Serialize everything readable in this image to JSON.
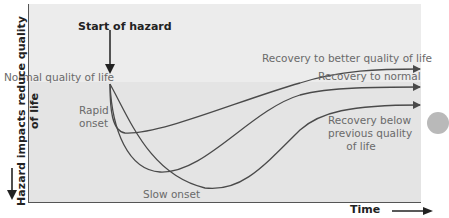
{
  "diagram": {
    "title_marker": "Start of hazard",
    "y_axis_label": "Hazard impacts reduce quality of life",
    "x_axis_label": "Time",
    "baseline_label": "Normal quality of life",
    "onset_labels": {
      "rapid": "Rapid onset",
      "rapid_line1": "Rapid",
      "rapid_line2": "onset",
      "slow": "Slow onset"
    },
    "outcomes": [
      {
        "id": "better",
        "label": "Recovery to better quality of life"
      },
      {
        "id": "normal",
        "label": "Recovery to normal"
      },
      {
        "id": "below",
        "label": "Recovery below previous quality of life",
        "lines": [
          "Recovery below",
          "previous quality",
          "of life"
        ]
      }
    ],
    "colors": {
      "background_upper": "#ececec",
      "background_lower": "#e4e4e4",
      "curve": "#4a4a4a",
      "label_text": "#6a6a6a",
      "axis_text": "#222222"
    }
  }
}
